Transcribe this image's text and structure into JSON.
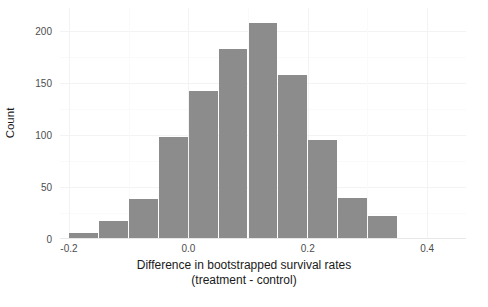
{
  "chart_data": {
    "type": "bar",
    "title": "",
    "subtitle": "",
    "xlabel_line1": "Difference in bootstrapped survival rates",
    "xlabel_line2": "(treatment - control)",
    "ylabel": "Count",
    "grid": true,
    "legend": "none",
    "bin_width": 0.05,
    "xlim": [
      -0.215,
      0.465
    ],
    "ylim": [
      0,
      222
    ],
    "xticks": [
      -0.2,
      0.0,
      0.2,
      0.4
    ],
    "xtick_labels": [
      "-0.2",
      "0.0",
      "0.2",
      "0.4"
    ],
    "yticks": [
      0,
      50,
      100,
      150,
      200
    ],
    "ytick_labels": [
      "0",
      "50",
      "100",
      "150",
      "200"
    ],
    "y_minor_ticks": [
      25,
      75,
      125,
      175
    ],
    "x_minor_ticks": [
      -0.1,
      0.1,
      0.3
    ],
    "bar_color": "#8c8c8c",
    "panel_background": "#ffffff",
    "gridline_color": "#f3f3f3",
    "bin_centers": [
      -0.175,
      -0.125,
      -0.075,
      -0.025,
      0.025,
      0.075,
      0.125,
      0.175,
      0.225,
      0.275,
      0.325
    ],
    "bin_starts": [
      -0.2,
      -0.15,
      -0.1,
      -0.05,
      0.0,
      0.05,
      0.1,
      0.15,
      0.2,
      0.25,
      0.3
    ],
    "values": [
      6,
      17,
      38,
      98,
      142,
      183,
      208,
      158,
      95,
      39,
      22
    ]
  }
}
